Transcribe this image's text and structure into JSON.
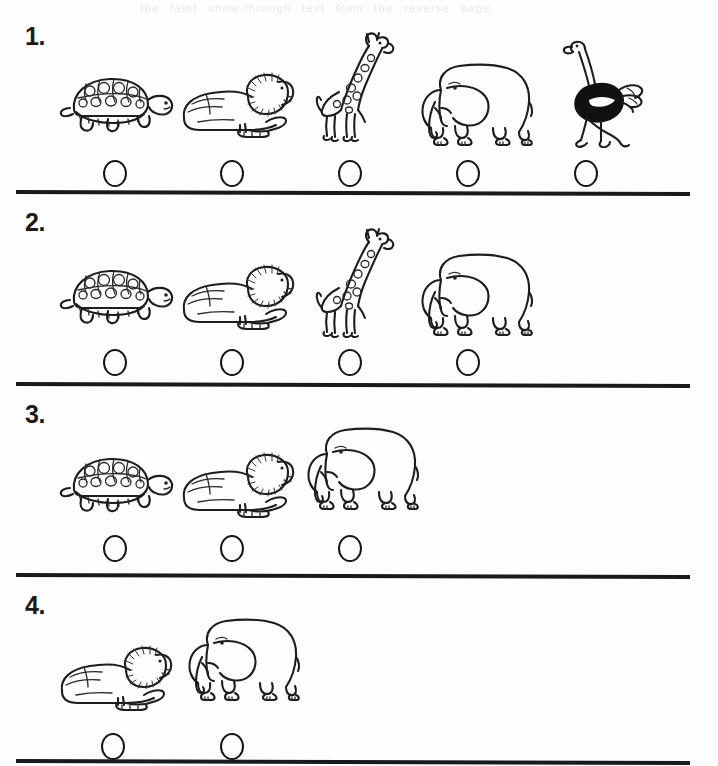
{
  "page": {
    "background_color": "#fdfdfd",
    "ink_color": "#1d1d1d",
    "ghost_text": "the faint show-through text from the reverse page",
    "width": 718,
    "height": 766
  },
  "worksheet": {
    "title": "Animal counting rows with answer bubbles",
    "rows": [
      {
        "number_label": "1.",
        "count": 5,
        "animals": [
          {
            "name": "turtle",
            "icon": "turtle-icon"
          },
          {
            "name": "lion",
            "icon": "lion-icon"
          },
          {
            "name": "giraffe",
            "icon": "giraffe-icon"
          },
          {
            "name": "elephant",
            "icon": "elephant-icon"
          },
          {
            "name": "ostrich",
            "icon": "ostrich-icon"
          }
        ],
        "bubbles": 5
      },
      {
        "number_label": "2.",
        "count": 4,
        "animals": [
          {
            "name": "turtle",
            "icon": "turtle-icon"
          },
          {
            "name": "lion",
            "icon": "lion-icon"
          },
          {
            "name": "giraffe",
            "icon": "giraffe-icon"
          },
          {
            "name": "elephant",
            "icon": "elephant-icon"
          }
        ],
        "bubbles": 4
      },
      {
        "number_label": "3.",
        "count": 3,
        "animals": [
          {
            "name": "turtle",
            "icon": "turtle-icon"
          },
          {
            "name": "lion",
            "icon": "lion-icon"
          },
          {
            "name": "elephant",
            "icon": "elephant-icon"
          }
        ],
        "bubbles": 3
      },
      {
        "number_label": "4.",
        "count": 2,
        "animals": [
          {
            "name": "lion",
            "icon": "lion-icon"
          },
          {
            "name": "elephant",
            "icon": "elephant-icon"
          }
        ],
        "bubbles": 2
      }
    ]
  }
}
